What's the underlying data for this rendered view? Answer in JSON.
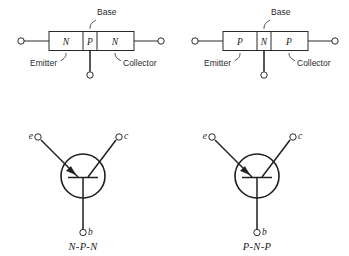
{
  "figure": {
    "background_color": "#ffffff",
    "line_color": "#2a2a2a"
  },
  "structures": [
    {
      "id": "npn-structure",
      "type": "N-P-N",
      "regions": [
        {
          "label": "N",
          "role": "emitter"
        },
        {
          "label": "P",
          "role": "base"
        },
        {
          "label": "N",
          "role": "collector"
        }
      ],
      "callouts": {
        "base": "Base",
        "emitter": "Emitter",
        "collector": "Collector"
      }
    },
    {
      "id": "pnp-structure",
      "type": "P-N-P",
      "regions": [
        {
          "label": "P",
          "role": "emitter"
        },
        {
          "label": "N",
          "role": "base"
        },
        {
          "label": "P",
          "role": "collector"
        }
      ],
      "callouts": {
        "base": "Base",
        "emitter": "Emitter",
        "collector": "Collector"
      }
    }
  ],
  "symbols": [
    {
      "id": "npn-symbol",
      "caption": "N-P-N",
      "terminals": {
        "emitter": "e",
        "collector": "c",
        "base": "b"
      }
    },
    {
      "id": "pnp-symbol",
      "caption": "P-N-P",
      "terminals": {
        "emitter": "e",
        "collector": "c",
        "base": "b"
      }
    }
  ]
}
